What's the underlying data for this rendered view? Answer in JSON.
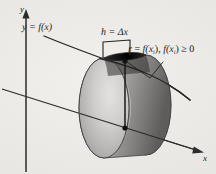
{
  "figure": {
    "kind": "calculus-disk-method-diagram",
    "background_color": "#e9e8e4",
    "ink_color": "#1b1b1b",
    "axes": {
      "y_axis_label": "y",
      "x_axis_label": "x"
    },
    "labels": {
      "curve": "y = f(x)",
      "height_prefix": "h = ",
      "height_value": "Δx",
      "radius_r": "r",
      "radius_eq": " = ",
      "radius_fx_1": "f(x",
      "radius_sub_1": "i",
      "radius_mid": "), ",
      "radius_fx_2": "f(x",
      "radius_sub_2": "i",
      "radius_tail": ") ≥ 0"
    },
    "disk": {
      "front_face_color": "#c9c8c6",
      "rim_color": "#9b9a98",
      "shadow_color": "#6f6e6c",
      "highlight_color": "#dedddb",
      "top_cap_color": "#3c3b3a",
      "outline_color": "#3a3a39"
    },
    "markers": {
      "top_point": "point-on-curve",
      "center_point": "point-on-axis",
      "radius_segment": "vertical-radius"
    }
  }
}
